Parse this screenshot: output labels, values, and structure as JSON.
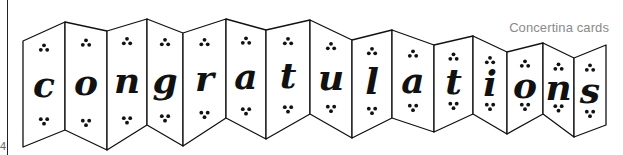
{
  "caption": "Concertina cards",
  "page_number": "4",
  "card": {
    "word": "congratulations",
    "letters": [
      "c",
      "o",
      "n",
      "g",
      "r",
      "a",
      "t",
      "u",
      "l",
      "a",
      "t",
      "i",
      "o",
      "n",
      "s"
    ],
    "colors": {
      "line": "#111111",
      "panel_fill": "#ffffff",
      "caption": "#8a8a8a"
    },
    "ornament": "three-dot-cluster",
    "folds": [
      {
        "x": 23,
        "top": 41,
        "bottom": 147
      },
      {
        "x": 65,
        "top": 22,
        "bottom": 130
      },
      {
        "x": 107,
        "top": 31,
        "bottom": 150
      },
      {
        "x": 147,
        "top": 19,
        "bottom": 125
      },
      {
        "x": 183,
        "top": 33,
        "bottom": 146
      },
      {
        "x": 226,
        "top": 19,
        "bottom": 118
      },
      {
        "x": 266,
        "top": 30,
        "bottom": 139
      },
      {
        "x": 310,
        "top": 20,
        "bottom": 114
      },
      {
        "x": 352,
        "top": 40,
        "bottom": 138
      },
      {
        "x": 392,
        "top": 30,
        "bottom": 118
      },
      {
        "x": 434,
        "top": 45,
        "bottom": 132
      },
      {
        "x": 473,
        "top": 36,
        "bottom": 114
      },
      {
        "x": 507,
        "top": 52,
        "bottom": 134
      },
      {
        "x": 543,
        "top": 43,
        "bottom": 114
      },
      {
        "x": 574,
        "top": 58,
        "bottom": 137
      },
      {
        "x": 606,
        "top": 45,
        "bottom": 125
      }
    ]
  }
}
